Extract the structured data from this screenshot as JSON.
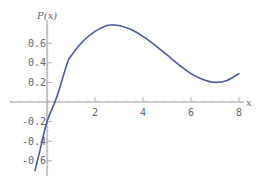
{
  "chart_data": {
    "type": "line",
    "title": "",
    "xlabel": "x",
    "ylabel": "P(x)",
    "xlim": [
      -0.5,
      8
    ],
    "ylim": [
      -0.7,
      0.8
    ],
    "grid": false,
    "x_ticks": [
      "2",
      "4",
      "6",
      "8"
    ],
    "y_ticks": [
      "0.6",
      "0.4",
      "0.2",
      "-0.2",
      "-0.4",
      "-0.6"
    ],
    "series": [
      {
        "name": "P(x)",
        "color": "#4a5a9c",
        "x": [
          -0.5,
          -0.25,
          0,
          0.33,
          0.5,
          0.85,
          1,
          1.5,
          2,
          2.5,
          2.75,
          3,
          3.5,
          4,
          4.5,
          5,
          5.5,
          6,
          6.5,
          7,
          7.5,
          8
        ],
        "y": [
          -0.7,
          -0.45,
          -0.2,
          0.0,
          0.12,
          0.4,
          0.47,
          0.62,
          0.72,
          0.78,
          0.785,
          0.78,
          0.74,
          0.67,
          0.58,
          0.48,
          0.38,
          0.29,
          0.23,
          0.2,
          0.22,
          0.29
        ]
      }
    ]
  }
}
